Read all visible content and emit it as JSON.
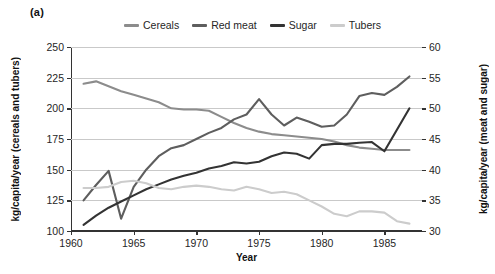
{
  "panel": {
    "label": "(a)"
  },
  "legend": {
    "position": "top-center",
    "entries": [
      {
        "label": "Cereals",
        "color": "#8c8c8c",
        "icon": "line-swatch-icon"
      },
      {
        "label": "Red meat",
        "color": "#5e5e5e",
        "icon": "line-swatch-icon"
      },
      {
        "label": "Sugar",
        "color": "#333333",
        "icon": "line-swatch-icon"
      },
      {
        "label": "Tubers",
        "color": "#cccccc",
        "icon": "line-swatch-icon"
      }
    ]
  },
  "chart_data": {
    "type": "line",
    "title": "",
    "subtitle": "",
    "xlabel": "Year",
    "ylabel": "kg/capita/year (cereals and tubers)",
    "ylabel_right": "kg/capita/year (meat and sugar)",
    "xlim": [
      1960,
      1988
    ],
    "ylim": [
      100,
      250
    ],
    "ylim_right": [
      30,
      60
    ],
    "xticks": [
      1960,
      1965,
      1970,
      1975,
      1980,
      1985
    ],
    "yticks": [
      100,
      125,
      150,
      175,
      200,
      225,
      250
    ],
    "yticks_right": [
      30,
      35,
      40,
      45,
      50,
      55,
      60
    ],
    "grid": true,
    "grid_axis": "y",
    "legend_position": "top-center",
    "x": [
      1961,
      1962,
      1963,
      1964,
      1965,
      1966,
      1967,
      1968,
      1969,
      1970,
      1971,
      1972,
      1973,
      1974,
      1975,
      1976,
      1977,
      1978,
      1979,
      1980,
      1981,
      1982,
      1983,
      1984,
      1985,
      1986,
      1987
    ],
    "series": [
      {
        "name": "Cereals",
        "axis": "left",
        "color": "#8c8c8c",
        "values": [
          220,
          222,
          218,
          214,
          211,
          208,
          205,
          200,
          199,
          199,
          198,
          193,
          188,
          184,
          181,
          179,
          178,
          177,
          176,
          175,
          173,
          170,
          168,
          167,
          166,
          166,
          166
        ]
      },
      {
        "name": "Red meat",
        "axis": "right",
        "color": "#5e5e5e",
        "values": [
          35.0,
          37.5,
          39.8,
          32.0,
          37.2,
          40.0,
          42.2,
          43.5,
          44.0,
          45.0,
          46.0,
          46.8,
          48.2,
          49.0,
          51.5,
          49.0,
          47.2,
          48.5,
          47.8,
          47.0,
          47.2,
          49.0,
          52.0,
          52.5,
          52.2,
          53.5,
          55.2
        ],
        "values_left_scale": [
          125,
          138,
          149,
          110,
          136,
          150,
          161,
          167,
          170,
          175,
          180,
          184,
          191,
          195,
          208,
          195,
          186,
          193,
          189,
          185,
          186,
          195,
          210,
          213,
          211,
          218,
          226
        ]
      },
      {
        "name": "Sugar",
        "axis": "right",
        "color": "#333333",
        "values": [
          31.0,
          32.5,
          33.8,
          34.8,
          35.8,
          36.8,
          37.6,
          38.4,
          39.0,
          39.5,
          40.2,
          40.6,
          41.2,
          41.0,
          41.3,
          42.2,
          42.8,
          42.6,
          41.8,
          44.0,
          44.2,
          44.2,
          44.4,
          44.5,
          43.0,
          46.5,
          50.0
        ],
        "values_left_scale": [
          106,
          113,
          119,
          124,
          129,
          134,
          138,
          142,
          145,
          148,
          151,
          153,
          156,
          155,
          157,
          161,
          164,
          163,
          159,
          170,
          171,
          171,
          172,
          173,
          165,
          183,
          200
        ]
      },
      {
        "name": "Tubers",
        "axis": "left",
        "color": "#cccccc",
        "values": [
          135,
          135,
          136,
          140,
          141,
          139,
          135,
          134,
          136,
          137,
          136,
          134,
          133,
          136,
          134,
          131,
          132,
          130,
          125,
          120,
          114,
          112,
          116,
          116,
          115,
          108,
          106
        ]
      }
    ]
  }
}
